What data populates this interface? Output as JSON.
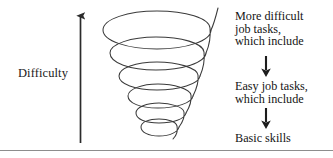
{
  "figure": {
    "type": "spiral-funnel-diagram",
    "background_color": "#ffffff",
    "line_color": "#333333",
    "text_color": "#141414"
  },
  "axis": {
    "label": "Difficulty",
    "direction": "upward",
    "arrow_icon": "up-arrow-icon"
  },
  "funnel": {
    "shape": "downward-narrowing-spiral",
    "loop_count": 6,
    "description": "Cone-shaped coil widest at the top, tapering to a point at the bottom"
  },
  "flow": {
    "blocks": [
      {
        "id": "top",
        "lines": [
          "More difficult",
          "job tasks,",
          "which include"
        ]
      },
      {
        "id": "middle",
        "lines": [
          "Easy job tasks,",
          "which include"
        ]
      },
      {
        "id": "bottom",
        "lines": [
          "Basic skills"
        ]
      }
    ],
    "connectors": [
      {
        "id": "arrow-1",
        "icon": "down-arrow-icon"
      },
      {
        "id": "arrow-2",
        "icon": "down-arrow-icon"
      }
    ]
  }
}
